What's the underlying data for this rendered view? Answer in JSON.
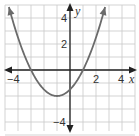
{
  "chart_data": {
    "type": "line",
    "title": "",
    "xlabel": "x",
    "ylabel": "y",
    "xlim": [
      -5,
      5
    ],
    "ylim": [
      -5,
      5
    ],
    "grid": true,
    "x_tick_labels": [
      "-4",
      "2",
      "4"
    ],
    "y_tick_labels": [
      "4",
      "2",
      "-4"
    ],
    "function": "y = 0.5(x + 1)^2 - 2",
    "vertex": [
      -1,
      -2
    ],
    "x_intercepts": [
      -3,
      1
    ],
    "y_intercept": -1.5,
    "series": [
      {
        "name": "parabola",
        "x": [
          -4.7,
          -4,
          -3,
          -2,
          -1,
          0,
          1,
          2,
          2.7
        ],
        "values": [
          4.85,
          2.5,
          0,
          -1.5,
          -2,
          -1.5,
          0,
          2.5,
          4.85
        ]
      }
    ],
    "colors": {
      "curve": "#6b6b6b",
      "axis": "#222222",
      "grid": "#c8c8c8"
    }
  },
  "labels": {
    "x_axis": "x",
    "y_axis": "y",
    "tick_x_neg4": "−4",
    "tick_x_2": "2",
    "tick_x_4": "4",
    "tick_y_4": "4",
    "tick_y_2": "2",
    "tick_y_neg4": "−4"
  }
}
